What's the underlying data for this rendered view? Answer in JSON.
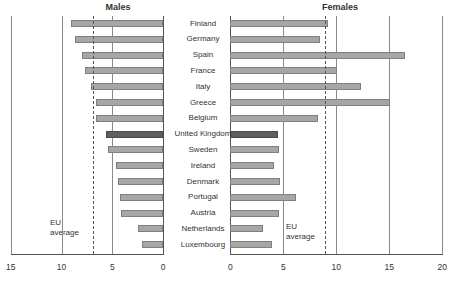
{
  "chart_data": {
    "type": "bar",
    "orientation": "horizontal",
    "layout": "butterfly",
    "categories": [
      "Finland",
      "Germany",
      "Spain",
      "France",
      "Italy",
      "Greece",
      "Belgium",
      "United Kingdom",
      "Sweden",
      "Ireland",
      "Denmark",
      "Portugal",
      "Austria",
      "Netherlands",
      "Luxembourg"
    ],
    "highlighted_category": "United Kingdom",
    "series": [
      {
        "name": "Males",
        "values": [
          9.1,
          8.7,
          8.0,
          7.7,
          7.1,
          6.6,
          6.6,
          5.6,
          5.4,
          4.6,
          4.4,
          4.2,
          4.1,
          2.5,
          2.1
        ],
        "eu_average": 6.9,
        "xlim": [
          15,
          0
        ],
        "ticks": [
          "15",
          "10",
          "5",
          "0"
        ]
      },
      {
        "name": "Females",
        "values": [
          9.2,
          8.5,
          16.5,
          10.1,
          12.3,
          15.1,
          8.3,
          4.5,
          4.6,
          4.1,
          4.7,
          6.2,
          4.6,
          3.1,
          3.9
        ],
        "eu_average": 8.9,
        "xlim": [
          0,
          20
        ],
        "ticks": [
          "0",
          "5",
          "10",
          "15",
          "20"
        ]
      }
    ],
    "annotations": [
      "EU average (dashed line)"
    ],
    "grid": true,
    "colors": {
      "bar": "#a6a6a6",
      "highlight": "#5e5e5e"
    }
  },
  "labels": {
    "males_title": "Males",
    "females_title": "Females",
    "eu_line1": "EU",
    "eu_line2": "average"
  }
}
